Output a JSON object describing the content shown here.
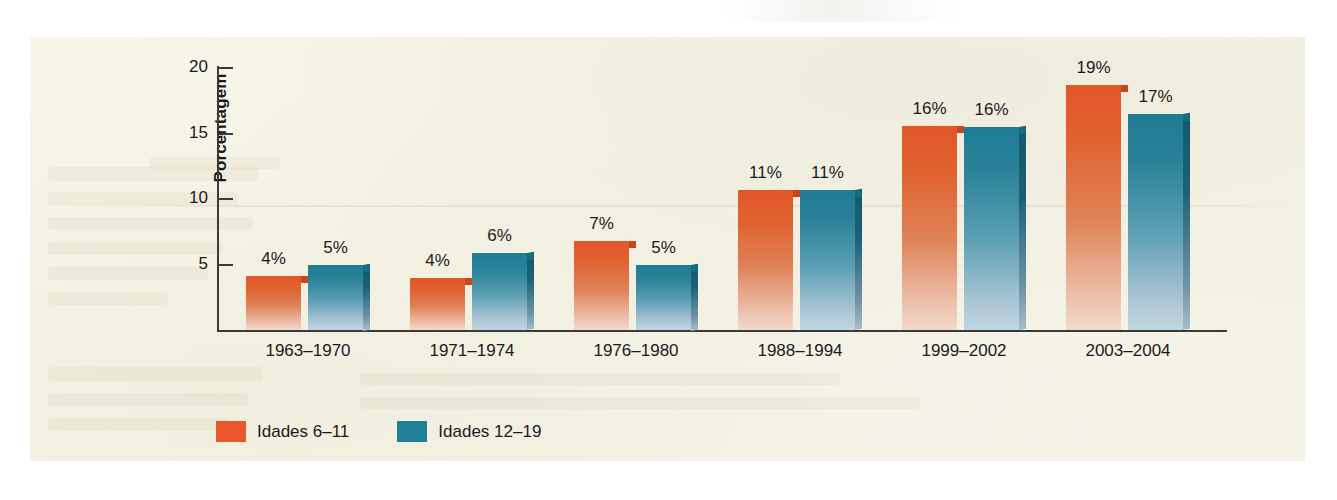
{
  "chart_data": {
    "type": "bar",
    "title": "",
    "xlabel": "",
    "ylabel": "Porcentagem",
    "ylim": [
      0,
      20
    ],
    "yticks": [
      5,
      10,
      15,
      20
    ],
    "grid": false,
    "legend_position": "bottom-left",
    "categories": [
      "1963–1970",
      "1971–1974",
      "1976–1980",
      "1988–1994",
      "1999–2002",
      "2003–2004"
    ],
    "series": [
      {
        "name": "Idades 6–11",
        "color": "#e2562a",
        "values": [
          4,
          4,
          7,
          11,
          16,
          19
        ],
        "labels": [
          "4%",
          "4%",
          "7%",
          "11%",
          "16%",
          "19%"
        ],
        "plotted": [
          4.1,
          4.0,
          6.8,
          10.7,
          15.6,
          18.7
        ]
      },
      {
        "name": "Idades 12–19",
        "color": "#1d7d95",
        "values": [
          5,
          6,
          5,
          11,
          16,
          17
        ],
        "labels": [
          "5%",
          "6%",
          "5%",
          "11%",
          "16%",
          "17%"
        ],
        "plotted": [
          5.0,
          5.9,
          5.0,
          10.7,
          15.5,
          16.5
        ]
      }
    ]
  },
  "axis": {
    "y_title": "Porcentagem",
    "y_tick_labels": [
      "5",
      "10",
      "15",
      "20"
    ]
  },
  "legend": {
    "items": [
      {
        "label": "Idades 6–11",
        "color": "#e8562a"
      },
      {
        "label": "Idades 12–19",
        "color": "#1e7f96"
      }
    ]
  },
  "colors": {
    "orange": "#e2562a",
    "teal": "#1d7d95",
    "panel": "#f7f5e8",
    "axis": "#3a3a38",
    "text": "#1b1b1b"
  }
}
